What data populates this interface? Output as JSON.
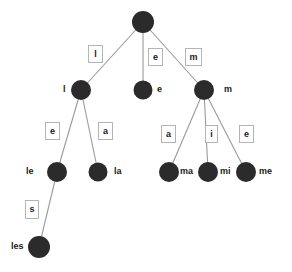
{
  "diagram": {
    "type": "trie",
    "title": "",
    "colors": {
      "node_fill": "#2b2b2b",
      "edge_stroke": "#9a9a9a",
      "label_box_border": "#b4b4b4",
      "background": "#ffffff",
      "text": "#1a1a1a"
    },
    "nodes": [
      {
        "id": "root",
        "label": "",
        "cx": 143,
        "cy": 22,
        "r": 11,
        "label_x": 0,
        "label_y": 0,
        "show_label": false
      },
      {
        "id": "l",
        "label": "l",
        "cx": 81,
        "cy": 90,
        "r": 10,
        "label_x": 63,
        "label_y": 85
      },
      {
        "id": "e",
        "label": "e",
        "cx": 143,
        "cy": 90,
        "r": 9.5,
        "label_x": 157,
        "label_y": 85
      },
      {
        "id": "m",
        "label": "m",
        "cx": 204,
        "cy": 90,
        "r": 10,
        "label_x": 224,
        "label_y": 85
      },
      {
        "id": "le",
        "label": "le",
        "cx": 57,
        "cy": 172,
        "r": 10,
        "label_x": 26,
        "label_y": 167
      },
      {
        "id": "la",
        "label": "la",
        "cx": 98,
        "cy": 172,
        "r": 9.5,
        "label_x": 114,
        "label_y": 167
      },
      {
        "id": "ma",
        "label": "ma",
        "cx": 169,
        "cy": 172,
        "r": 10,
        "label_x": 180,
        "label_y": 167
      },
      {
        "id": "mi",
        "label": "mi",
        "cx": 208,
        "cy": 172,
        "r": 10,
        "label_x": 220,
        "label_y": 167
      },
      {
        "id": "me",
        "label": "me",
        "cx": 246,
        "cy": 172,
        "r": 10,
        "label_x": 259,
        "label_y": 167
      },
      {
        "id": "les",
        "label": "les",
        "cx": 39,
        "cy": 247,
        "r": 11,
        "label_x": 11,
        "label_y": 242
      }
    ],
    "edges": [
      {
        "id": "root-l",
        "from": "root",
        "to": "l",
        "label": "l",
        "x1": 143,
        "y1": 22,
        "x2": 81,
        "y2": 90,
        "box_x": 88,
        "box_y": 45,
        "box_w": 15,
        "box_h": 18
      },
      {
        "id": "root-e",
        "from": "root",
        "to": "e",
        "label": "e",
        "x1": 143,
        "y1": 22,
        "x2": 143,
        "y2": 90,
        "box_x": 148,
        "box_y": 48,
        "box_w": 15,
        "box_h": 18
      },
      {
        "id": "root-m",
        "from": "root",
        "to": "m",
        "label": "m",
        "x1": 143,
        "y1": 22,
        "x2": 204,
        "y2": 90,
        "box_x": 185,
        "box_y": 48,
        "box_w": 17,
        "box_h": 18
      },
      {
        "id": "l-le",
        "from": "l",
        "to": "le",
        "label": "e",
        "x1": 81,
        "y1": 90,
        "x2": 57,
        "y2": 172,
        "box_x": 45,
        "box_y": 122,
        "box_w": 15,
        "box_h": 18
      },
      {
        "id": "l-la",
        "from": "l",
        "to": "la",
        "label": "a",
        "x1": 81,
        "y1": 90,
        "x2": 98,
        "y2": 172,
        "box_x": 98,
        "box_y": 122,
        "box_w": 15,
        "box_h": 18
      },
      {
        "id": "le-les",
        "from": "le",
        "to": "les",
        "label": "s",
        "x1": 57,
        "y1": 172,
        "x2": 39,
        "y2": 247,
        "box_x": 25,
        "box_y": 200,
        "box_w": 14,
        "box_h": 19
      },
      {
        "id": "m-ma",
        "from": "m",
        "to": "ma",
        "label": "a",
        "x1": 204,
        "y1": 90,
        "x2": 169,
        "y2": 172,
        "box_x": 161,
        "box_y": 125,
        "box_w": 15,
        "box_h": 18
      },
      {
        "id": "m-mi",
        "from": "m",
        "to": "mi",
        "label": "i",
        "x1": 204,
        "y1": 90,
        "x2": 208,
        "y2": 172,
        "box_x": 205,
        "box_y": 125,
        "box_w": 13,
        "box_h": 18
      },
      {
        "id": "m-me",
        "from": "m",
        "to": "me",
        "label": "e",
        "x1": 204,
        "y1": 90,
        "x2": 246,
        "y2": 172,
        "box_x": 239,
        "box_y": 125,
        "box_w": 15,
        "box_h": 18
      }
    ]
  }
}
